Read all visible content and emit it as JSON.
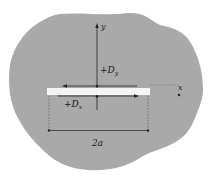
{
  "diagram": {
    "colors": {
      "body_fill": "#a9a9a9",
      "crack_fill": "#f4f4f4",
      "line": "#222222"
    },
    "axes": {
      "x_label": "x",
      "y_label": "y"
    },
    "labels": {
      "dy": "+D",
      "dy_sub": "y",
      "dx": "+D",
      "dx_sub": "x",
      "crack_length": "2a"
    }
  }
}
